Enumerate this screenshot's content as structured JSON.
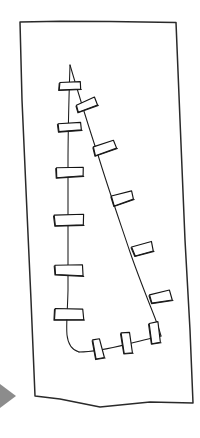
{
  "figure": {
    "background_color": "#ffffff",
    "ink_color": "#1b1b1b",
    "frame_color": "#2a2a2a"
  },
  "frame": {
    "name": "hand-drawn-rectangle",
    "corners": [
      {
        "x": 20,
        "y": 21
      },
      {
        "x": 176,
        "y": 22
      },
      {
        "x": 193,
        "y": 403
      },
      {
        "x": 35,
        "y": 396
      }
    ],
    "path": "M20,22 L60,21.2 L110,21.6 L176,22.4 L180,120 L185,240 L190,330 L193,403 L150,402 L100,407 L60,399 L35,396 L31,300 L26,190 L22,100 Z"
  },
  "incision": {
    "name": "closure-line",
    "apex": {
      "x": 70,
      "y": 65
    },
    "left_limb_path": "M70,65 C69,95 68,130 68,165 C68,205 68,250 68,290 C67.5,312 66,325 67,335 C68,344 72,350 79,352",
    "right_limb_path": "M70,65 C78,92 88,125 98,155 C108,188 120,222 130,252 C139,278 148,300 155,318 C158,326 160,332 161,336",
    "bottom_path": "M79,352 C95,352 112,348 128,344 C140,341 152,338 161,336"
  },
  "staples": {
    "name": "staple-marks",
    "count": 17,
    "left_column": [
      {
        "id": "l1",
        "cx": 70,
        "cy": 86,
        "w": 21,
        "h": 7,
        "angle": -4
      },
      {
        "id": "l2",
        "cx": 70,
        "cy": 127,
        "w": 22,
        "h": 8,
        "angle": -3
      },
      {
        "id": "l3",
        "cx": 70,
        "cy": 172,
        "w": 27,
        "h": 9,
        "angle": -2
      },
      {
        "id": "l4",
        "cx": 69,
        "cy": 220,
        "w": 29,
        "h": 10,
        "angle": -1
      },
      {
        "id": "l5",
        "cx": 69,
        "cy": 270,
        "w": 28,
        "h": 10,
        "angle": 0
      },
      {
        "id": "l6",
        "cx": 69,
        "cy": 314,
        "w": 28,
        "h": 10,
        "angle": 0
      }
    ],
    "right_column": [
      {
        "id": "r1",
        "cx": 87,
        "cy": 105,
        "w": 20,
        "h": 8,
        "angle": -22
      },
      {
        "id": "r2",
        "cx": 105,
        "cy": 148,
        "w": 22,
        "h": 9,
        "angle": -18
      },
      {
        "id": "r3",
        "cx": 123,
        "cy": 198,
        "w": 21,
        "h": 9,
        "angle": -16
      },
      {
        "id": "r4",
        "cx": 143,
        "cy": 249,
        "w": 20,
        "h": 9,
        "angle": -14
      },
      {
        "id": "r5",
        "cx": 161,
        "cy": 297,
        "w": 21,
        "h": 9,
        "angle": -12
      }
    ],
    "bottom_row": [
      {
        "id": "b1",
        "cx": 98,
        "cy": 349,
        "w": 8,
        "h": 20,
        "angle": -12
      },
      {
        "id": "b2",
        "cx": 127,
        "cy": 343,
        "w": 8,
        "h": 21,
        "angle": -10
      },
      {
        "id": "b3",
        "cx": 155,
        "cy": 333,
        "w": 8,
        "h": 21,
        "angle": -8
      }
    ]
  },
  "play_triangle": {
    "name": "expand-arrow",
    "color": "#8c8c8c",
    "direction": "right",
    "x": 0,
    "y": 384,
    "width": 16,
    "height": 24
  }
}
